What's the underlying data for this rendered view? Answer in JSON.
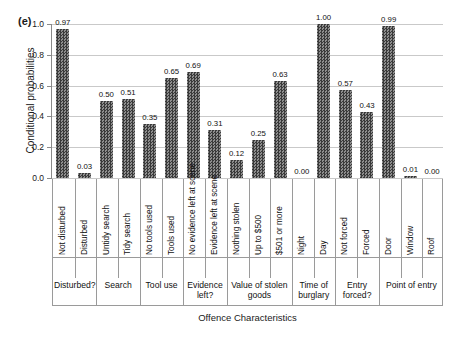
{
  "figure": {
    "panel_label": "(e)",
    "ylabel": "Conditional probabilities",
    "xlabel": "Offence Characteristics"
  },
  "chart_data": {
    "type": "bar",
    "title": "",
    "panel": "(e)",
    "xlabel": "Offence Characteristics",
    "ylabel": "Conditional probabilities",
    "ylim": [
      0.0,
      1.0
    ],
    "yticks": [
      "0.0",
      "0.2",
      "0.4",
      "0.6",
      "0.8",
      "1.0"
    ],
    "ytick_values": [
      0.0,
      0.2,
      0.4,
      0.6,
      0.8,
      1.0
    ],
    "grid": true,
    "legend": "none",
    "bar_color": "#4d4d4d",
    "bar_pattern": "checkerboard-dots",
    "categories": [
      "Not disturbed",
      "Disturbed",
      "Untidy search",
      "Tidy search",
      "No tools used",
      "Tools used",
      "No evidence left at scene",
      "Evidence left at scene",
      "Nothing stolen",
      "Up to $500",
      "$501 or more",
      "Night",
      "Day",
      "Not forced",
      "Forced",
      "Door",
      "Window",
      "Roof"
    ],
    "values": [
      0.97,
      0.03,
      0.5,
      0.51,
      0.35,
      0.65,
      0.69,
      0.31,
      0.12,
      0.25,
      0.63,
      0.0,
      1.0,
      0.57,
      0.43,
      0.99,
      0.01,
      0.0
    ],
    "value_labels": [
      "0.97",
      "0.03",
      "0.50",
      "0.51",
      "0.35",
      "0.65",
      "0.69",
      "0.31",
      "0.12",
      "0.25",
      "0.63",
      "0.00",
      "1.00",
      "0.57",
      "0.43",
      "0.99",
      "0.01",
      "0.00"
    ],
    "groups": [
      {
        "label": "Disturbed?",
        "count": 2
      },
      {
        "label": "Search",
        "count": 2
      },
      {
        "label": "Tool use",
        "count": 2
      },
      {
        "label": "Evidence left?",
        "count": 2
      },
      {
        "label": "Value of stolen goods",
        "count": 3
      },
      {
        "label": "Time of burglary",
        "count": 2
      },
      {
        "label": "Entry forced?",
        "count": 2
      },
      {
        "label": "Point of entry",
        "count": 3
      }
    ]
  }
}
